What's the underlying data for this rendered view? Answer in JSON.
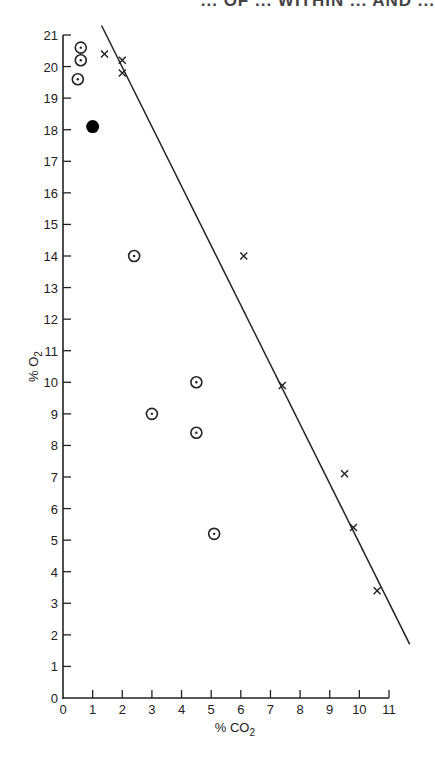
{
  "header": {
    "title_fragment": "... OF ... WITHIN ... AND ..."
  },
  "chart_data": {
    "type": "scatter",
    "title": "",
    "xlabel": "% CO2",
    "ylabel": "% O2",
    "xlim": [
      0,
      11
    ],
    "ylim": [
      0,
      21
    ],
    "x_ticks": [
      0,
      1,
      2,
      3,
      4,
      5,
      6,
      7,
      8,
      9,
      10,
      11
    ],
    "y_ticks": [
      0,
      1,
      2,
      3,
      4,
      5,
      6,
      7,
      8,
      9,
      10,
      11,
      12,
      13,
      14,
      15,
      16,
      17,
      18,
      19,
      20,
      21
    ],
    "grid": false,
    "legend": null,
    "series": [
      {
        "name": "circled-dot",
        "marker": "circle-dot",
        "points": [
          [
            0.6,
            20.6
          ],
          [
            0.6,
            20.2
          ],
          [
            0.5,
            19.6
          ],
          [
            2.4,
            14.0
          ],
          [
            4.5,
            10.0
          ],
          [
            3.0,
            9.0
          ],
          [
            4.5,
            8.4
          ],
          [
            5.1,
            5.2
          ]
        ]
      },
      {
        "name": "filled-circle",
        "marker": "filled-circle",
        "points": [
          [
            1.0,
            18.1
          ]
        ]
      },
      {
        "name": "cross",
        "marker": "x",
        "points": [
          [
            1.4,
            20.4
          ],
          [
            2.0,
            20.2
          ],
          [
            2.0,
            19.8
          ],
          [
            6.1,
            14.0
          ],
          [
            7.4,
            9.9
          ],
          [
            9.5,
            7.1
          ],
          [
            9.8,
            5.4
          ],
          [
            10.6,
            3.4
          ]
        ]
      }
    ],
    "reference_line": {
      "from": [
        1.3,
        21.3
      ],
      "to": [
        11.7,
        1.7
      ]
    }
  },
  "colors": {
    "ink": "#222222",
    "background": "#ffffff"
  }
}
